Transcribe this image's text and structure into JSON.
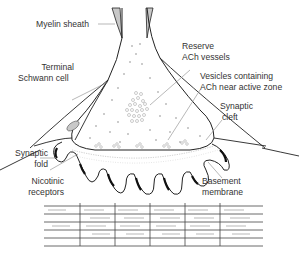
{
  "labels": {
    "myelin_sheath": "Myelin sheath",
    "reserve_ach_1": "Reserve",
    "reserve_ach_2": "ACh vessels",
    "terminal_schwann_1": "Terminal",
    "terminal_schwann_2": "Schwann cell",
    "vesicles_1": "Vesicles containing",
    "vesicles_2": "ACh near active zone",
    "synaptic_cleft_1": "Synaptic",
    "synaptic_cleft_2": "cleft",
    "synaptic_fold_1": "Synaptic",
    "synaptic_fold_2": "fold",
    "nicotinic_1": "Nicotinic",
    "nicotinic_2": "receptors",
    "basement_1": "Basement",
    "basement_2": "membrane"
  },
  "colors": {
    "line": "#222222",
    "myelin_fill": "#c8c8c8",
    "vesicle": "#aaaaaa",
    "label_text": "#333333",
    "leader": "#888888"
  }
}
